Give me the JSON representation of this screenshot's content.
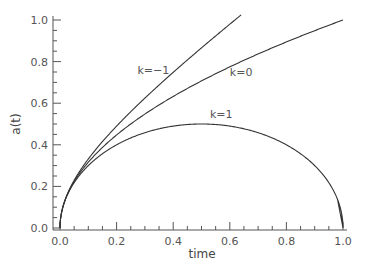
{
  "chart_data": {
    "type": "line",
    "title": "",
    "xlabel": "time",
    "ylabel": "a(t)",
    "xlim": [
      0.0,
      1.0
    ],
    "ylim": [
      0.0,
      1.0
    ],
    "grid": false,
    "legend": "inline labels",
    "x_ticks": [
      "0.0",
      "0.2",
      "0.4",
      "0.6",
      "0.8",
      "1.0"
    ],
    "y_ticks": [
      "0.0",
      "0.2",
      "0.4",
      "0.6",
      "0.8",
      "1.0"
    ],
    "series": [
      {
        "name": "k=-1",
        "formula": "a = sqrt(t + t^2)",
        "x": [
          0.0,
          0.05,
          0.1,
          0.2,
          0.3,
          0.4,
          0.5,
          0.6,
          0.64
        ],
        "values": [
          0.0,
          0.23,
          0.33,
          0.49,
          0.62,
          0.75,
          0.87,
          0.98,
          1.02
        ]
      },
      {
        "name": "k=0",
        "formula": "a = sqrt(t)",
        "x": [
          0.0,
          0.05,
          0.1,
          0.2,
          0.3,
          0.4,
          0.5,
          0.6,
          0.7,
          0.8,
          0.9,
          1.0
        ],
        "values": [
          0.0,
          0.22,
          0.32,
          0.45,
          0.55,
          0.63,
          0.71,
          0.77,
          0.84,
          0.89,
          0.95,
          1.0
        ]
      },
      {
        "name": "k=1",
        "formula": "a = sqrt(t - t^2)",
        "x": [
          0.0,
          0.05,
          0.1,
          0.2,
          0.3,
          0.4,
          0.5,
          0.6,
          0.7,
          0.8,
          0.9,
          0.95,
          1.0
        ],
        "values": [
          0.0,
          0.22,
          0.3,
          0.4,
          0.46,
          0.49,
          0.5,
          0.49,
          0.46,
          0.4,
          0.3,
          0.22,
          0.0
        ]
      }
    ],
    "annotations": [
      {
        "text": "k=−1",
        "x": 0.33,
        "y": 0.74
      },
      {
        "text": "k=0",
        "x": 0.64,
        "y": 0.73
      },
      {
        "text": "k=1",
        "x": 0.57,
        "y": 0.53
      }
    ]
  }
}
